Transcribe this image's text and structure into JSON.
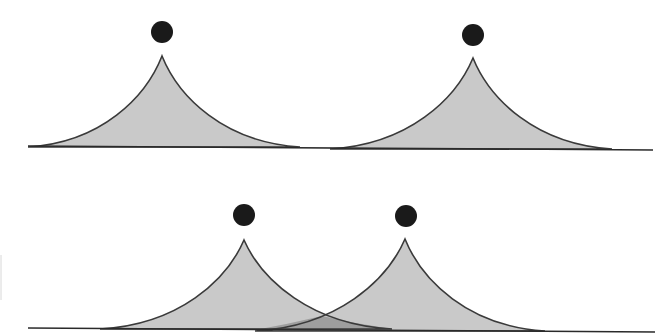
{
  "diagram": {
    "colors": {
      "peak_fill": "#c9c9c9",
      "overlap_fill": "#9e9e9e",
      "outline": "#3a3a3a",
      "baseline": "#2a2a2a",
      "dot": "#1a1a1a",
      "background": "#ffffff"
    },
    "top_panel": {
      "baseline": {
        "x1": 28,
        "y1": 146,
        "x2": 653,
        "y2": 150
      },
      "peaks": [
        {
          "apex_x": 162,
          "apex_y": 56,
          "left_x": 28,
          "right_x": 300,
          "base_y": 147,
          "dot": {
            "cx": 162,
            "cy": 32,
            "r": 11
          }
        },
        {
          "apex_x": 473,
          "apex_y": 58,
          "left_x": 330,
          "right_x": 612,
          "base_y": 149,
          "dot": {
            "cx": 473,
            "cy": 35,
            "r": 11
          }
        }
      ]
    },
    "bottom_panel": {
      "baseline": {
        "x1": 28,
        "y1": 328,
        "x2": 655,
        "y2": 332
      },
      "overlap_point": {
        "x": 322,
        "y": 316
      },
      "peaks": [
        {
          "apex_x": 244,
          "apex_y": 240,
          "left_x": 100,
          "right_x": 392,
          "base_y": 329,
          "dot": {
            "cx": 244,
            "cy": 215,
            "r": 11
          }
        },
        {
          "apex_x": 405,
          "apex_y": 239,
          "left_x": 255,
          "right_x": 545,
          "base_y": 331,
          "dot": {
            "cx": 406,
            "cy": 216,
            "r": 11
          }
        }
      ]
    }
  }
}
